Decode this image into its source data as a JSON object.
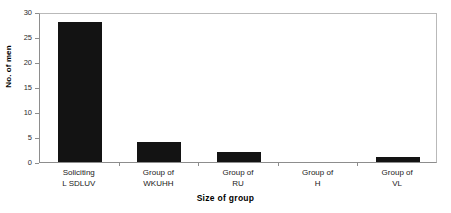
{
  "chart_data": {
    "type": "bar",
    "title": "",
    "xlabel": "Size of group",
    "ylabel": "No. of men",
    "categories": [
      "Soliciting\nL  SDLUV",
      "Group of\nWKUHH",
      "Group of\nRU",
      "Group of\nH",
      "Group of\nVL"
    ],
    "values": [
      28,
      4,
      2,
      0,
      1
    ],
    "ylim": [
      0,
      30
    ],
    "yticks": [
      0,
      5,
      10,
      15,
      20,
      25,
      30
    ],
    "ytick_labels": [
      "0",
      "5",
      "10",
      "15",
      "20",
      "25",
      "30"
    ],
    "grid": false,
    "legend": false,
    "bar_color": "#131313",
    "axis_color": "#8d8d8d",
    "frame_color": "#b9b9b9"
  }
}
